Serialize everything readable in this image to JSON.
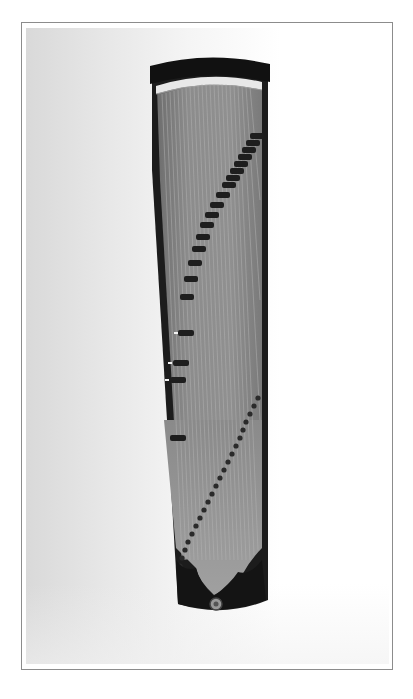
{
  "image": {
    "subject": "guzheng",
    "description": "Overhead photo of a guzheng (Chinese zither) with diagonal rows of dark bridges, framed by a thin gray border",
    "colors": {
      "frame_border": "#8c8c8c",
      "body_wood": "#8a8a8a",
      "rim_dark": "#1a1a1a",
      "bridge": "#222222",
      "nut_ivory": "#e8e8e8"
    }
  }
}
